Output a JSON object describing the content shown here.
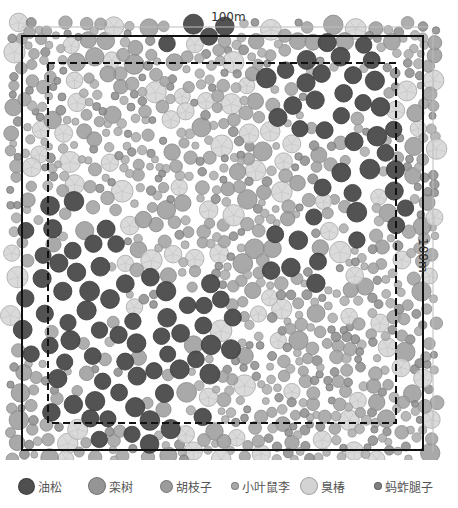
{
  "chart_data": {
    "type": "scatter",
    "title": "",
    "xlabel": "100m",
    "ylabel": "100m",
    "xlim": [
      0,
      100
    ],
    "ylim": [
      0,
      100
    ],
    "grid": false,
    "legend_position": "bottom",
    "plot_boundary": {
      "style": "solid",
      "extent_m": [
        0,
        100
      ]
    },
    "inner_buffer_boundary": {
      "style": "dashed",
      "inset_m": 6.7
    },
    "series": [
      {
        "name": "油松",
        "color": "#505050",
        "relative_size": "large",
        "pattern": "clustered: left-center, upper-right, lower-left bands"
      },
      {
        "name": "栾树",
        "color": "#909090",
        "relative_size": "medium-large",
        "pattern": "scattered, denser lower-center"
      },
      {
        "name": "胡枝子",
        "color": "#959595",
        "relative_size": "medium",
        "pattern": "scattered throughout"
      },
      {
        "name": "小叶鼠李",
        "color": "#a5a5a5",
        "relative_size": "small",
        "pattern": "scattered throughout"
      },
      {
        "name": "臭椿",
        "color": "#d0d0d0",
        "relative_size": "large",
        "pattern": "scattered throughout, upper-left and center"
      },
      {
        "name": "蚂蚱腿子",
        "color": "#8a8a8a",
        "relative_size": "small",
        "pattern": "scattered throughout"
      }
    ]
  },
  "dimensions": {
    "top_label": "100m",
    "right_label": "100m"
  },
  "legend": {
    "items": [
      {
        "label": "油松",
        "color": "#4f4f4f",
        "size": 17,
        "x": 18
      },
      {
        "label": "栾树",
        "color": "#959595",
        "size": 18,
        "x": 88
      },
      {
        "label": "胡枝子",
        "color": "#9c9c9c",
        "size": 13,
        "x": 160
      },
      {
        "label": "小叶鼠李",
        "color": "#a8a8a8",
        "size": 8,
        "x": 231
      },
      {
        "label": "臭椿",
        "color": "#d3d3d3",
        "size": 18,
        "x": 300
      },
      {
        "label": "蚂蚱腿子",
        "color": "#7f7f7f",
        "size": 8,
        "x": 374
      }
    ]
  },
  "render": {
    "seed": 20240517,
    "frame": {
      "x0": 22,
      "y0": 36,
      "x1": 423,
      "y1": 450
    },
    "dashed": {
      "x0": 48,
      "y0": 63,
      "x1": 396,
      "y1": 423
    },
    "ref_top": {
      "y": 27,
      "x0": 22,
      "x1": 428
    },
    "ref_right": {
      "x": 433,
      "y0": 32,
      "y1": 452
    },
    "species_style": [
      {
        "fill": "#4a4a4a",
        "stroke": "#3a3a3a",
        "rmin": 8,
        "rmax": 10,
        "spokes": false
      },
      {
        "fill": "#9a9a9a",
        "stroke": "#888888",
        "rmin": 7,
        "rmax": 10,
        "spokes": false
      },
      {
        "fill": "#a0a0a0",
        "stroke": "#8f8f8f",
        "rmin": 5,
        "rmax": 7,
        "spokes": false
      },
      {
        "fill": "#ababab",
        "stroke": "#999999",
        "rmin": 3.5,
        "rmax": 5,
        "spokes": false
      },
      {
        "fill": "#d4d4d4",
        "stroke": "#a8a8a8",
        "rmin": 8,
        "rmax": 11,
        "spokes": true
      },
      {
        "fill": "#8c8c8c",
        "stroke": "#7a7a7a",
        "rmin": 3.5,
        "rmax": 5,
        "spokes": false
      }
    ],
    "pine_zones": [
      {
        "cx": 340,
        "cy": 95,
        "rx": 80,
        "ry": 60
      },
      {
        "cx": 360,
        "cy": 190,
        "rx": 55,
        "ry": 55
      },
      {
        "cx": 70,
        "cy": 290,
        "rx": 60,
        "ry": 110
      },
      {
        "cx": 170,
        "cy": 330,
        "rx": 70,
        "ry": 60
      },
      {
        "cx": 120,
        "cy": 410,
        "rx": 100,
        "ry": 40
      },
      {
        "cx": 300,
        "cy": 250,
        "rx": 45,
        "ry": 40
      },
      {
        "cx": 190,
        "cy": 35,
        "rx": 40,
        "ry": 20
      }
    ]
  }
}
